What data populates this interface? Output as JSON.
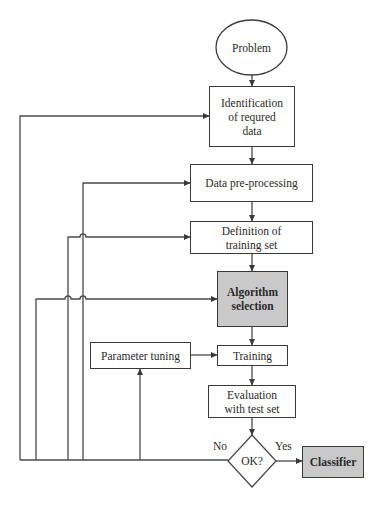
{
  "diagram": {
    "colors": {
      "line": "#4a4a4a",
      "box_border": "#3a3a3a",
      "highlight_fill": "#c9c9c9",
      "background": "#ffffff"
    },
    "nodes": {
      "problem": {
        "label": "Problem",
        "shape": "ellipse"
      },
      "identification": {
        "label": "Identification of requred data",
        "line1": "Identification",
        "line2": "of requred",
        "line3": "data",
        "shape": "rectangle"
      },
      "preprocessing": {
        "label": "Data pre-processing",
        "shape": "rectangle"
      },
      "definition": {
        "label": "Definition of training set",
        "line1": "Definition of",
        "line2": "training set",
        "shape": "rectangle"
      },
      "algorithm": {
        "label": "Algorithm selection",
        "line1": "Algorithm",
        "line2": "selection",
        "shape": "rectangle",
        "highlighted": true
      },
      "parameter_tuning": {
        "label": "Parameter tuning",
        "shape": "rectangle"
      },
      "training": {
        "label": "Training",
        "shape": "rectangle"
      },
      "evaluation": {
        "label": "Evaluation with test set",
        "line1": "Evaluation",
        "line2": "with test set",
        "shape": "rectangle"
      },
      "decision": {
        "label": "OK?",
        "shape": "diamond"
      },
      "classifier": {
        "label": "Classifier",
        "shape": "rectangle",
        "highlighted": true
      }
    },
    "edge_labels": {
      "no": "No",
      "yes": "Yes"
    },
    "edges": [
      {
        "from": "problem",
        "to": "identification"
      },
      {
        "from": "identification",
        "to": "preprocessing"
      },
      {
        "from": "preprocessing",
        "to": "definition"
      },
      {
        "from": "definition",
        "to": "algorithm"
      },
      {
        "from": "algorithm",
        "to": "training"
      },
      {
        "from": "parameter_tuning",
        "to": "training"
      },
      {
        "from": "training",
        "to": "evaluation"
      },
      {
        "from": "evaluation",
        "to": "decision"
      },
      {
        "from": "decision",
        "to": "classifier",
        "label": "Yes"
      },
      {
        "from": "decision",
        "to": "identification",
        "label": "No"
      },
      {
        "from": "decision",
        "to": "preprocessing",
        "label": "No"
      },
      {
        "from": "decision",
        "to": "definition",
        "label": "No"
      },
      {
        "from": "decision",
        "to": "algorithm",
        "label": "No"
      },
      {
        "from": "decision",
        "to": "parameter_tuning",
        "label": "No"
      }
    ]
  }
}
